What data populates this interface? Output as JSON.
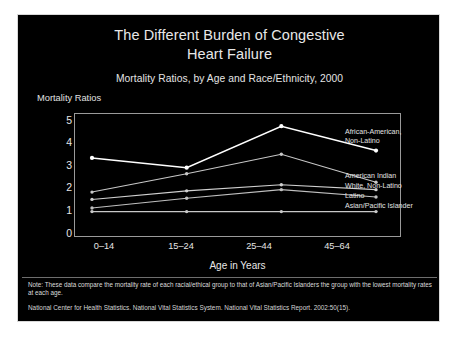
{
  "slide": {
    "title": "The Different Burden of Congestive\nHeart Failure",
    "title_line1": "The Different Burden of Congestive",
    "title_line2": "Heart Failure",
    "subtitle": "Mortality Ratios, by Age and Race/Ethnicity, 2000",
    "note": "Note: These data compare the mortality rate of each racial/ethical group to that of Asian/Pacific Islanders the group with the lowest mortality rates at each age.",
    "source": "National Center for Health Statistics. National Vital Statistics System. National Vital Statistics Report. 2002:50(15).",
    "background_color": "#000000",
    "text_color": "#e6e6e6",
    "border_color": "#d8d8d8"
  },
  "chart_data": {
    "type": "line",
    "title": "The Different Burden of Congestive Heart Failure",
    "subtitle": "Mortality Ratios, by Age and Race/Ethnicity, 2000",
    "xlabel": "Age in Years",
    "ylabel": "Mortality Ratios",
    "categories": [
      "0–14",
      "15–24",
      "25–44",
      "45–64"
    ],
    "ylim": [
      0,
      5
    ],
    "yticks": [
      0,
      1,
      2,
      3,
      4,
      5
    ],
    "ytick_labels": [
      "0",
      "1",
      "2",
      "3",
      "4",
      "5"
    ],
    "grid": false,
    "legend_position": "right-inline-labels",
    "series": [
      {
        "name": "African-American, Non-Latino",
        "values": [
          3.2,
          2.8,
          4.5,
          3.5
        ],
        "color": "#ffffff"
      },
      {
        "name": "American Indian",
        "values": [
          1.8,
          2.55,
          3.35,
          2.2
        ],
        "color": "#c8c8c8"
      },
      {
        "name": "White, Non-Latino",
        "values": [
          1.5,
          1.85,
          2.1,
          1.9
        ],
        "color": "#d0d0d0"
      },
      {
        "name": "Latino",
        "values": [
          1.15,
          1.55,
          1.9,
          1.6
        ],
        "color": "#c0c0c0"
      },
      {
        "name": "Asian/Pacific Islander",
        "values": [
          1.0,
          1.0,
          1.0,
          1.0
        ],
        "color": "#c8c8c8"
      }
    ]
  },
  "series_labels": [
    {
      "text": "African-American,\nNon-Latino"
    },
    {
      "text": "American Indian"
    },
    {
      "text": "White, Non-Latino"
    },
    {
      "text": "Latino"
    },
    {
      "text": "Asian/Pacific Islander"
    }
  ]
}
